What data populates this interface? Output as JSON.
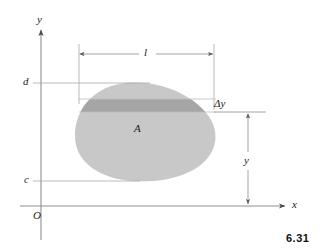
{
  "figure": {
    "number": "6.31",
    "type": "math-diagram"
  },
  "axes": {
    "x_label": "x",
    "y_label": "y",
    "origin_label": "O",
    "x_axis_y_px": 206,
    "y_axis_x_px": 41,
    "x_axis_end_px": 287,
    "y_axis_top_px": 28
  },
  "labels": {
    "upper_bound": "d",
    "lower_bound": "c",
    "area": "A",
    "strip_width": "l",
    "strip_thickness": "Δy",
    "height": "y"
  },
  "colors": {
    "region_fill": "#c8c8c8",
    "strip_fill": "#a8a8a8",
    "line": "#9a9a9a",
    "text": "#1a1a1a",
    "background": "#ffffff"
  },
  "geometry": {
    "region_top_px": 83,
    "region_bottom_px": 181,
    "region_left_px": 75,
    "region_right_px": 216,
    "strip_top_px": 99,
    "strip_bottom_px": 112,
    "dim_l_left_px": 79,
    "dim_l_right_px": 214,
    "dim_l_y_px": 54,
    "dim_y_x_px": 248,
    "dim_y_top_px": 113,
    "dim_y_bottom_px": 205
  }
}
